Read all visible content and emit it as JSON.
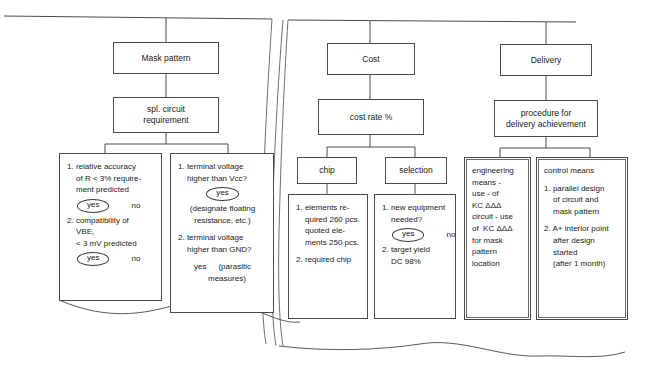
{
  "diagram": {
    "type": "flowchart",
    "background_color": "#ffffff",
    "line_color": "#4a4a4a",
    "text_color": "#1a1a1a",
    "columns": [
      {
        "key": "mask_pattern",
        "root_label": "Mask pattern",
        "second_label_line1": "spl. circuit",
        "second_label_line2": "requirement"
      },
      {
        "key": "cost",
        "root_label": "Cost",
        "second_label": "cost rate %",
        "child_left": "chip",
        "child_right": "selection"
      },
      {
        "key": "delivery",
        "root_label": "Delivery",
        "second_label_line1": "procedure for",
        "second_label_line2": "delivery achievement"
      }
    ],
    "detail_boxes": {
      "mask_left": {
        "name": "relative-accuracy-box",
        "lines": [
          "1. relative accuracy",
          "of R < 3% require-",
          "ment predicted"
        ],
        "answer1_yes": "yes",
        "answer1_no": "no",
        "lines2": [
          "2. compatibility of",
          "VBE,",
          "< 3 mV predicted"
        ],
        "answer2_yes": "yes",
        "answer2_no": "no"
      },
      "mask_right": {
        "name": "terminal-voltage-box",
        "lines": [
          "1. terminal voltage",
          "higher than Vcc?"
        ],
        "answer1_yes": "yes",
        "note1_line1": "(designate floating",
        "note1_line2": "resistance, etc.)",
        "lines2": [
          "2. terminal voltage",
          "higher than GND?"
        ],
        "answer2_yes": "yes",
        "note2_line1": "(parasitic",
        "note2_line2": "measures)"
      },
      "chip_detail": {
        "name": "chip-elements-box",
        "lines": [
          "1. elements re-",
          "quired 260 pcs.",
          "quoted ele-",
          "ments 250 pcs."
        ],
        "line2": "2. required chip"
      },
      "selection_detail": {
        "name": "new-equipment-box",
        "lines": [
          "1. new equipment",
          "needed?"
        ],
        "answer1_yes": "yes",
        "answer1_no": "no",
        "lines2": [
          "2. target yield",
          "DC 98%"
        ]
      },
      "engineering_means": {
        "name": "engineering-means-box",
        "lines": [
          "engineering",
          "means -",
          "use - of",
          "KC ΔΔΔ",
          "circuit - use",
          "of  KC ΔΔΔ",
          "for mask",
          "pattern",
          "location"
        ]
      },
      "control_means": {
        "name": "control-means-box",
        "heading": "control means",
        "lines1": [
          "1. parallel design",
          "of circuit and",
          "mask pattern"
        ],
        "lines2": [
          "2. A+ interior point",
          "after design",
          "started",
          "(after 1 month)"
        ]
      }
    }
  }
}
